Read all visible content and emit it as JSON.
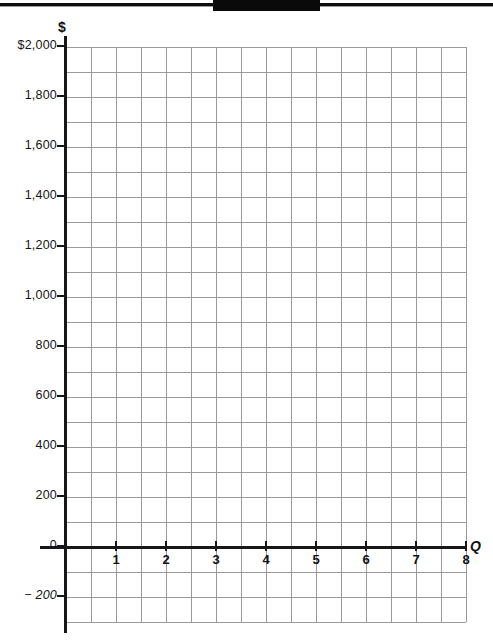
{
  "page": {
    "background_color": "#ffffff",
    "width": 493,
    "height": 640
  },
  "decorations": {
    "top_rule": "",
    "top_block": ""
  },
  "chart_data": {
    "type": "grid",
    "title": "",
    "subtitle": "",
    "xlabel": "Q",
    "ylabel": "$",
    "series": [],
    "values": [],
    "categories": [],
    "grid": true,
    "legend": null,
    "annotations": [],
    "xlim": [
      0,
      8.8
    ],
    "ylim": [
      -300,
      2100
    ],
    "x_ticks": [
      {
        "value": 1,
        "label": "1"
      },
      {
        "value": 2,
        "label": "2"
      },
      {
        "value": 3,
        "label": "3"
      },
      {
        "value": 4,
        "label": "4"
      },
      {
        "value": 5,
        "label": "5"
      },
      {
        "value": 6,
        "label": "6"
      },
      {
        "value": 7,
        "label": "7"
      },
      {
        "value": 8,
        "label": "8"
      }
    ],
    "y_ticks": [
      {
        "value": 2000,
        "label": "$2,000"
      },
      {
        "value": 1800,
        "label": "1,800"
      },
      {
        "value": 1600,
        "label": "1,600"
      },
      {
        "value": 1400,
        "label": "1,400"
      },
      {
        "value": 1200,
        "label": "1,200"
      },
      {
        "value": 1000,
        "label": "1,000"
      },
      {
        "value": 800,
        "label": "800"
      },
      {
        "value": 600,
        "label": "600"
      },
      {
        "value": 400,
        "label": "400"
      },
      {
        "value": 200,
        "label": "200"
      },
      {
        "value": 0,
        "label": "0"
      },
      {
        "value": -200,
        "label": "− 200"
      }
    ],
    "grid_color": "#9a9a9e",
    "axis_color": "#17171a",
    "minor_step_y": 100,
    "minor_step_x": 0.5
  }
}
